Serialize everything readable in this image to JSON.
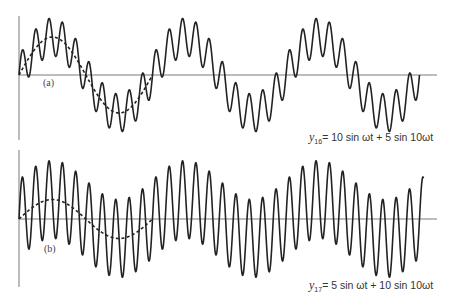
{
  "chart_data": [
    {
      "type": "line",
      "panel_label": "(a)",
      "equation": {
        "var": "y",
        "sub": "16",
        "rhs": "= 10 sin ωt + 5 sin 10ωt"
      },
      "title": "y16 = 10 sin ωt + 5 sin 10ωt",
      "series": [
        {
          "name": "composite",
          "style": "solid",
          "components": [
            {
              "amplitude": 10,
              "harmonic": 1
            },
            {
              "amplitude": 5,
              "harmonic": 10
            }
          ],
          "periods": 3.0
        },
        {
          "name": "fundamental",
          "style": "dashed",
          "components": [
            {
              "amplitude": 10,
              "harmonic": 1
            }
          ],
          "periods": 1.0
        }
      ],
      "xlabel": "",
      "ylabel": "",
      "ylim": [
        -15,
        15
      ],
      "grid": false
    },
    {
      "type": "line",
      "panel_label": "(b)",
      "equation": {
        "var": "y",
        "sub": "17",
        "rhs": "= 5 sin ωt + 10 sin 10ωt"
      },
      "title": "y17 = 5 sin ωt + 10 sin 10ωt",
      "series": [
        {
          "name": "composite",
          "style": "solid",
          "components": [
            {
              "amplitude": 5,
              "harmonic": 1
            },
            {
              "amplitude": 10,
              "harmonic": 10
            }
          ],
          "periods": 3.03
        },
        {
          "name": "fundamental",
          "style": "dashed",
          "components": [
            {
              "amplitude": 5,
              "harmonic": 1
            }
          ],
          "periods": 1.0
        }
      ],
      "xlabel": "",
      "ylabel": "",
      "ylim": [
        -15,
        15
      ],
      "grid": false
    }
  ],
  "layout": {
    "panels": [
      {
        "x0": 19,
        "baseline": 75,
        "axis_top": 16,
        "axis_bottom": 140,
        "axis_right": 437,
        "period_px": 133.5,
        "px_per_unit": 3.8
      },
      {
        "x0": 19,
        "baseline": 219,
        "axis_top": 150,
        "axis_bottom": 287,
        "axis_right": 437,
        "period_px": 133.5,
        "px_per_unit": 3.9
      }
    ]
  }
}
